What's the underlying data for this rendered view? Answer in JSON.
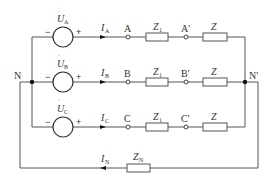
{
  "diagram": {
    "neutral_left": "N",
    "neutral_right": "N'",
    "phases": [
      {
        "source_symbol": "U",
        "source_sub": "A",
        "current_symbol": "I",
        "current_sub": "A",
        "node": "A",
        "node_load": "A'",
        "line_impedance": "Z",
        "line_impedance_sub": "1",
        "load_impedance": "Z",
        "minus": "−",
        "plus": "+"
      },
      {
        "source_symbol": "U",
        "source_sub": "B",
        "current_symbol": "I",
        "current_sub": "B",
        "node": "B",
        "node_load": "B'",
        "line_impedance": "Z",
        "line_impedance_sub": "1",
        "load_impedance": "Z",
        "minus": "−",
        "plus": "+"
      },
      {
        "source_symbol": "U",
        "source_sub": "C",
        "current_symbol": "I",
        "current_sub": "C",
        "node": "C",
        "node_load": "C'",
        "line_impedance": "Z",
        "line_impedance_sub": "1",
        "load_impedance": "Z",
        "minus": "−",
        "plus": "+"
      }
    ],
    "neutral_line": {
      "current_symbol": "I",
      "current_sub": "N",
      "impedance": "Z",
      "impedance_sub": "N"
    },
    "colors": {
      "wire": "#555555",
      "text": "#333333",
      "background": "#ffffff"
    }
  }
}
